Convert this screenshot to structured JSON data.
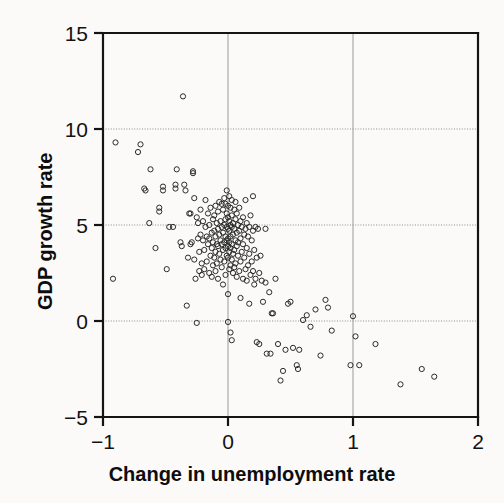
{
  "chart_data": {
    "type": "scatter",
    "title": "",
    "xlabel": "Change in unemployment rate",
    "ylabel": "GDP growth rate",
    "xlim": [
      -1,
      2
    ],
    "ylim": [
      -5,
      15
    ],
    "xticks": [
      -1,
      0,
      1,
      2
    ],
    "xticklabels": [
      "−1",
      "0",
      "1",
      "2"
    ],
    "yticks": [
      -5,
      0,
      5,
      10,
      15
    ],
    "yticklabels": [
      "−5",
      "0",
      "5",
      "10",
      "15"
    ],
    "grid": {
      "horizontal": [
        0,
        5,
        10
      ],
      "vertical": [
        0,
        1
      ],
      "style": "dotted-gray"
    },
    "legend": null,
    "marker": {
      "shape": "open-circle",
      "radius": 2.6,
      "edge_color": "#2b2b2b",
      "fill_color": "none",
      "line_width": 1.0
    },
    "n_points": 202,
    "points": [
      [
        -0.9,
        9.3
      ],
      [
        -0.92,
        2.2
      ],
      [
        -0.7,
        9.2
      ],
      [
        -0.72,
        8.8
      ],
      [
        -0.66,
        6.8
      ],
      [
        -0.67,
        6.9
      ],
      [
        -0.62,
        7.9
      ],
      [
        -0.63,
        5.1
      ],
      [
        -0.58,
        3.8
      ],
      [
        -0.55,
        5.9
      ],
      [
        -0.55,
        5.7
      ],
      [
        -0.52,
        6.8
      ],
      [
        -0.52,
        7.0
      ],
      [
        -0.49,
        2.7
      ],
      [
        -0.47,
        4.9
      ],
      [
        -0.44,
        4.9
      ],
      [
        -0.42,
        6.9
      ],
      [
        -0.42,
        7.1
      ],
      [
        -0.41,
        7.9
      ],
      [
        -0.38,
        4.1
      ],
      [
        -0.37,
        3.9
      ],
      [
        -0.36,
        11.7
      ],
      [
        -0.35,
        7.1
      ],
      [
        -0.34,
        6.8
      ],
      [
        -0.33,
        0.8
      ],
      [
        -0.32,
        3.3
      ],
      [
        -0.31,
        5.6
      ],
      [
        -0.3,
        5.6
      ],
      [
        -0.3,
        4.0
      ],
      [
        -0.29,
        4.1
      ],
      [
        -0.28,
        7.8
      ],
      [
        -0.28,
        7.7
      ],
      [
        -0.27,
        6.4
      ],
      [
        -0.27,
        3.2
      ],
      [
        -0.26,
        2.2
      ],
      [
        -0.25,
        5.4
      ],
      [
        -0.25,
        -0.1
      ],
      [
        -0.24,
        5.1
      ],
      [
        -0.24,
        4.3
      ],
      [
        -0.23,
        3.6
      ],
      [
        -0.23,
        2.6
      ],
      [
        -0.22,
        5.8
      ],
      [
        -0.22,
        4.5
      ],
      [
        -0.21,
        3.0
      ],
      [
        -0.21,
        2.4
      ],
      [
        -0.2,
        5.2
      ],
      [
        -0.2,
        4.2
      ],
      [
        -0.19,
        3.7
      ],
      [
        -0.19,
        2.7
      ],
      [
        -0.18,
        6.3
      ],
      [
        -0.18,
        4.9
      ],
      [
        -0.17,
        4.4
      ],
      [
        -0.17,
        3.1
      ],
      [
        -0.16,
        5.6
      ],
      [
        -0.16,
        4.0
      ],
      [
        -0.15,
        5.0
      ],
      [
        -0.15,
        4.3
      ],
      [
        -0.15,
        2.5
      ],
      [
        -0.14,
        5.9
      ],
      [
        -0.14,
        3.4
      ],
      [
        -0.13,
        4.6
      ],
      [
        -0.13,
        3.8
      ],
      [
        -0.13,
        2.3
      ],
      [
        -0.12,
        5.3
      ],
      [
        -0.12,
        4.1
      ],
      [
        -0.12,
        2.9
      ],
      [
        -0.11,
        5.5
      ],
      [
        -0.11,
        4.7
      ],
      [
        -0.11,
        3.3
      ],
      [
        -0.1,
        6.0
      ],
      [
        -0.1,
        4.4
      ],
      [
        -0.1,
        3.6
      ],
      [
        -0.1,
        2.6
      ],
      [
        -0.09,
        5.1
      ],
      [
        -0.09,
        4.0
      ],
      [
        -0.09,
        3.0
      ],
      [
        -0.08,
        5.7
      ],
      [
        -0.08,
        4.8
      ],
      [
        -0.08,
        3.9
      ],
      [
        -0.08,
        2.2
      ],
      [
        -0.07,
        6.2
      ],
      [
        -0.07,
        4.5
      ],
      [
        -0.07,
        3.5
      ],
      [
        -0.06,
        5.2
      ],
      [
        -0.06,
        4.2
      ],
      [
        -0.06,
        3.2
      ],
      [
        -0.05,
        6.1
      ],
      [
        -0.05,
        4.9
      ],
      [
        -0.05,
        4.0
      ],
      [
        -0.05,
        2.8
      ],
      [
        -0.04,
        5.8
      ],
      [
        -0.04,
        4.6
      ],
      [
        -0.04,
        3.7
      ],
      [
        -0.04,
        1.9
      ],
      [
        -0.03,
        6.4
      ],
      [
        -0.03,
        5.0
      ],
      [
        -0.03,
        4.1
      ],
      [
        -0.03,
        3.1
      ],
      [
        -0.02,
        6.1
      ],
      [
        -0.02,
        5.3
      ],
      [
        -0.02,
        4.4
      ],
      [
        -0.02,
        3.8
      ],
      [
        -0.02,
        2.4
      ],
      [
        -0.01,
        6.8
      ],
      [
        -0.01,
        5.6
      ],
      [
        -0.01,
        4.9
      ],
      [
        -0.01,
        4.2
      ],
      [
        -0.01,
        3.4
      ],
      [
        0.0,
        6.0
      ],
      [
        0.0,
        5.4
      ],
      [
        0.0,
        4.8
      ],
      [
        0.0,
        4.3
      ],
      [
        0.0,
        3.9
      ],
      [
        0.0,
        3.3
      ],
      [
        0.0,
        1.4
      ],
      [
        0.0,
        -0.05
      ],
      [
        0.01,
        6.5
      ],
      [
        0.01,
        5.2
      ],
      [
        0.01,
        4.7
      ],
      [
        0.01,
        4.1
      ],
      [
        0.01,
        3.6
      ],
      [
        0.01,
        2.7
      ],
      [
        0.02,
        5.9
      ],
      [
        0.02,
        5.0
      ],
      [
        0.02,
        4.4
      ],
      [
        0.02,
        3.8
      ],
      [
        0.02,
        2.9
      ],
      [
        0.02,
        -0.6
      ],
      [
        0.03,
        6.3
      ],
      [
        0.03,
        5.5
      ],
      [
        0.03,
        4.9
      ],
      [
        0.03,
        4.0
      ],
      [
        0.03,
        3.2
      ],
      [
        0.03,
        -1.0
      ],
      [
        0.04,
        5.1
      ],
      [
        0.04,
        4.5
      ],
      [
        0.04,
        3.5
      ],
      [
        0.04,
        2.5
      ],
      [
        0.05,
        5.8
      ],
      [
        0.05,
        4.8
      ],
      [
        0.05,
        3.7
      ],
      [
        0.05,
        2.8
      ],
      [
        0.06,
        6.2
      ],
      [
        0.06,
        5.3
      ],
      [
        0.06,
        4.2
      ],
      [
        0.06,
        3.0
      ],
      [
        0.07,
        5.6
      ],
      [
        0.07,
        4.6
      ],
      [
        0.07,
        3.9
      ],
      [
        0.07,
        2.3
      ],
      [
        0.08,
        5.0
      ],
      [
        0.08,
        4.1
      ],
      [
        0.08,
        3.4
      ],
      [
        0.09,
        5.9
      ],
      [
        0.09,
        4.7
      ],
      [
        0.09,
        2.6
      ],
      [
        0.1,
        5.2
      ],
      [
        0.1,
        4.3
      ],
      [
        0.1,
        3.1
      ],
      [
        0.1,
        1.2
      ],
      [
        0.11,
        4.9
      ],
      [
        0.11,
        3.6
      ],
      [
        0.12,
        5.4
      ],
      [
        0.12,
        4.0
      ],
      [
        0.12,
        2.2
      ],
      [
        0.13,
        4.5
      ],
      [
        0.13,
        3.3
      ],
      [
        0.14,
        6.3
      ],
      [
        0.14,
        4.8
      ],
      [
        0.14,
        2.7
      ],
      [
        0.15,
        5.1
      ],
      [
        0.15,
        3.8
      ],
      [
        0.15,
        2.1
      ],
      [
        0.16,
        4.4
      ],
      [
        0.16,
        2.9
      ],
      [
        0.17,
        4.9
      ],
      [
        0.17,
        3.5
      ],
      [
        0.17,
        0.9
      ],
      [
        0.18,
        5.5
      ],
      [
        0.18,
        2.4
      ],
      [
        0.19,
        4.2
      ],
      [
        0.19,
        3.1
      ],
      [
        0.2,
        6.5
      ],
      [
        0.2,
        4.7
      ],
      [
        0.2,
        2.6
      ],
      [
        0.21,
        3.7
      ],
      [
        0.21,
        1.9
      ],
      [
        0.22,
        4.9
      ],
      [
        0.22,
        2.2
      ],
      [
        0.23,
        3.3
      ],
      [
        0.23,
        -1.1
      ],
      [
        0.24,
        4.8
      ],
      [
        0.25,
        2.5
      ],
      [
        0.25,
        -1.2
      ],
      [
        0.26,
        3.4
      ],
      [
        0.27,
        2.1
      ],
      [
        0.28,
        1.0
      ],
      [
        0.3,
        2.0
      ],
      [
        0.3,
        4.8
      ],
      [
        0.31,
        -1.7
      ],
      [
        0.33,
        1.5
      ],
      [
        0.34,
        -1.7
      ],
      [
        0.35,
        0.4
      ],
      [
        0.36,
        0.4
      ],
      [
        0.38,
        2.2
      ],
      [
        0.4,
        -1.2
      ],
      [
        0.42,
        -3.1
      ],
      [
        0.44,
        -2.6
      ],
      [
        0.46,
        -1.5
      ],
      [
        0.48,
        0.9
      ],
      [
        0.5,
        1.0
      ],
      [
        0.52,
        -1.4
      ],
      [
        0.55,
        -2.3
      ],
      [
        0.56,
        -2.5
      ],
      [
        0.57,
        -1.5
      ],
      [
        0.6,
        0.05
      ],
      [
        0.63,
        0.3
      ],
      [
        0.66,
        -0.3
      ],
      [
        0.7,
        0.6
      ],
      [
        0.74,
        -1.8
      ],
      [
        0.78,
        1.1
      ],
      [
        0.8,
        0.7
      ],
      [
        0.83,
        -0.5
      ],
      [
        1.0,
        0.25
      ],
      [
        1.02,
        -0.8
      ],
      [
        0.98,
        -2.3
      ],
      [
        1.05,
        -2.3
      ],
      [
        1.18,
        -1.2
      ],
      [
        1.38,
        -3.3
      ],
      [
        1.55,
        -2.5
      ],
      [
        1.65,
        -2.9
      ]
    ]
  }
}
